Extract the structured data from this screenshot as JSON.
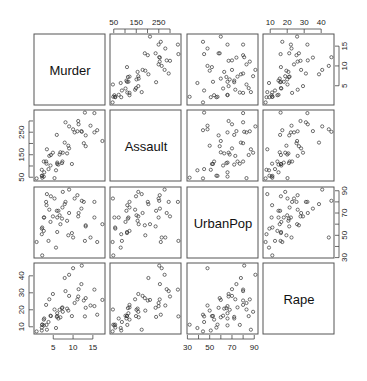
{
  "chart_data": {
    "type": "scatter",
    "subtype": "scatterplot_matrix",
    "title": "",
    "variables": [
      "Murder",
      "Assault",
      "UrbanPop",
      "Rape"
    ],
    "axis_ticks": {
      "Murder": [
        5,
        10,
        15
      ],
      "Assault": [
        50,
        100,
        150,
        200,
        250,
        300
      ],
      "UrbanPop": [
        30,
        40,
        50,
        60,
        70,
        80,
        90
      ],
      "Rape": [
        10,
        20,
        30,
        40
      ]
    },
    "axis_tick_labels": {
      "Murder": [
        "5",
        "10",
        "15"
      ],
      "Assault": [
        "50",
        "150",
        "250"
      ],
      "UrbanPop": [
        "30",
        "50",
        "70",
        "90"
      ],
      "Rape": [
        "10",
        "20",
        "30",
        "40"
      ]
    },
    "axis_placement": {
      "top": [
        "Assault",
        "Rape"
      ],
      "bottom": [
        "Murder",
        "UrbanPop"
      ],
      "left": [
        "Assault",
        "Rape"
      ],
      "right": [
        "Murder",
        "UrbanPop"
      ]
    },
    "grid": false,
    "legend": null,
    "point_style": "open circle",
    "point_color": "#333333",
    "rows": [
      [
        13.2,
        236,
        58,
        21.2
      ],
      [
        10.0,
        263,
        48,
        44.5
      ],
      [
        8.1,
        294,
        80,
        31.0
      ],
      [
        8.8,
        190,
        50,
        19.5
      ],
      [
        9.0,
        276,
        91,
        40.6
      ],
      [
        7.9,
        204,
        78,
        38.7
      ],
      [
        3.3,
        110,
        77,
        11.1
      ],
      [
        5.9,
        238,
        72,
        15.8
      ],
      [
        15.4,
        335,
        80,
        31.9
      ],
      [
        17.4,
        211,
        60,
        25.8
      ],
      [
        5.3,
        46,
        83,
        20.2
      ],
      [
        2.6,
        120,
        54,
        14.2
      ],
      [
        10.4,
        249,
        83,
        24.0
      ],
      [
        7.2,
        113,
        65,
        21.0
      ],
      [
        2.2,
        56,
        57,
        11.3
      ],
      [
        6.0,
        115,
        66,
        18.0
      ],
      [
        9.7,
        109,
        52,
        16.3
      ],
      [
        15.4,
        249,
        66,
        22.2
      ],
      [
        2.1,
        83,
        51,
        7.8
      ],
      [
        11.3,
        300,
        67,
        27.8
      ],
      [
        4.4,
        149,
        85,
        16.3
      ],
      [
        12.1,
        255,
        74,
        35.1
      ],
      [
        2.7,
        72,
        66,
        14.9
      ],
      [
        16.1,
        259,
        44,
        17.1
      ],
      [
        9.0,
        178,
        70,
        28.2
      ],
      [
        6.0,
        109,
        53,
        16.4
      ],
      [
        4.3,
        102,
        62,
        16.5
      ],
      [
        12.2,
        252,
        81,
        46.0
      ],
      [
        2.1,
        57,
        56,
        9.5
      ],
      [
        7.4,
        159,
        89,
        18.8
      ],
      [
        11.4,
        285,
        70,
        32.1
      ],
      [
        11.1,
        254,
        86,
        26.1
      ],
      [
        13.0,
        337,
        45,
        16.1
      ],
      [
        0.8,
        45,
        44,
        7.3
      ],
      [
        7.3,
        120,
        75,
        21.4
      ],
      [
        6.6,
        151,
        68,
        20.0
      ],
      [
        4.9,
        159,
        67,
        29.3
      ],
      [
        6.3,
        106,
        72,
        14.9
      ],
      [
        3.4,
        174,
        87,
        8.3
      ],
      [
        14.4,
        279,
        48,
        22.5
      ],
      [
        3.8,
        86,
        45,
        12.8
      ],
      [
        13.2,
        188,
        59,
        26.9
      ],
      [
        12.7,
        201,
        80,
        25.5
      ],
      [
        3.2,
        120,
        80,
        22.9
      ],
      [
        2.2,
        48,
        32,
        11.2
      ],
      [
        8.5,
        156,
        63,
        20.7
      ],
      [
        4.0,
        145,
        73,
        26.2
      ],
      [
        5.7,
        81,
        39,
        9.3
      ],
      [
        2.6,
        53,
        66,
        10.8
      ],
      [
        6.8,
        161,
        60,
        15.6
      ]
    ]
  },
  "labels": {
    "murder": "Murder",
    "assault": "Assault",
    "urbanpop": "UrbanPop",
    "rape": "Rape"
  }
}
